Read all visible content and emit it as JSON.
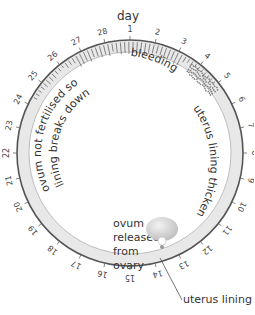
{
  "title": "day",
  "days": [
    "1",
    "2",
    "3",
    "4",
    "5",
    "6",
    "7",
    "8",
    "9",
    "10",
    "11",
    "12",
    "13",
    "14",
    "15",
    "16",
    "17",
    "18",
    "19",
    "20",
    "21",
    "22",
    "23",
    "24",
    "25",
    "26",
    "27",
    "28"
  ],
  "labels": {
    "bleeding": "bleeding",
    "thickens": "uterus lining thickens",
    "breakdown_line1": "ovum not fertilised so",
    "breakdown_line2": "lining breaks down",
    "ovum_line1": "ovum",
    "ovum_line2": "released",
    "ovum_line3": "from",
    "ovum_line4": "ovary",
    "uterus_lining": "uterus lining"
  },
  "colors": {
    "ring": "#555555",
    "lining_fill": "#e6e6e6",
    "text": "#333333",
    "ovary": "#cfcfcf"
  }
}
